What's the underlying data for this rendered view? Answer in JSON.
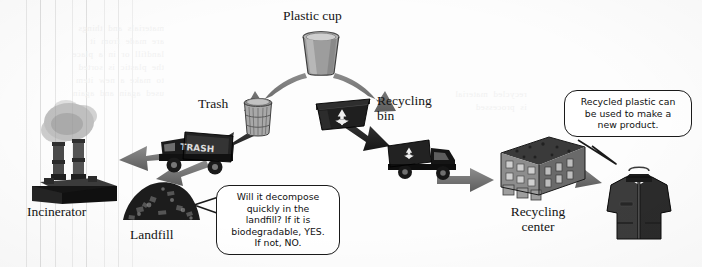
{
  "diagram": {
    "title_semantic": "plastic-cup-lifecycle-flow",
    "nodes": [
      {
        "id": "plastic-cup",
        "label": "Plastic cup",
        "icon": "plastic-cup-icon"
      },
      {
        "id": "trash",
        "label": "Trash",
        "icon": "trash-can-icon"
      },
      {
        "id": "recycling-bin",
        "label": "Recycling\nbin",
        "label_line1": "Recycling",
        "label_line2": "bin",
        "icon": "recycling-bin-icon"
      },
      {
        "id": "trash-truck",
        "label": "TRASH",
        "icon": "garbage-truck-icon"
      },
      {
        "id": "recycling-truck",
        "label": "",
        "icon": "recycling-truck-icon"
      },
      {
        "id": "incinerator",
        "label": "Incinerator",
        "icon": "incinerator-icon"
      },
      {
        "id": "landfill",
        "label": "Landfill",
        "icon": "landfill-icon"
      },
      {
        "id": "recycling-center",
        "label_line1": "Recycling",
        "label_line2": "center",
        "label": "Recycling center",
        "icon": "factory-icon"
      },
      {
        "id": "new-product",
        "label": "",
        "icon": "fleece-jacket-icon"
      }
    ],
    "callouts": [
      {
        "id": "landfill-question",
        "text": "Will it decompose quickly in the landfill? If it is biodegradable, YES. If not, NO.",
        "lines": [
          "Will it decompose",
          "quickly in the",
          "landfill? If it is",
          "biodegradable, YES.",
          "If not, NO."
        ]
      },
      {
        "id": "recycled-product-note",
        "text": "Recycled plastic can be used to make a new product.",
        "lines": [
          "Recycled plastic can",
          "be used to make a",
          "new product."
        ]
      }
    ],
    "flow_edges": [
      {
        "from": "plastic-cup",
        "to": "trash"
      },
      {
        "from": "plastic-cup",
        "to": "recycling-bin"
      },
      {
        "from": "trash",
        "to": "trash-truck"
      },
      {
        "from": "trash-truck",
        "to": "incinerator"
      },
      {
        "from": "trash-truck",
        "to": "landfill"
      },
      {
        "from": "recycling-bin",
        "to": "recycling-truck"
      },
      {
        "from": "recycling-truck",
        "to": "recycling-center"
      },
      {
        "from": "recycling-center",
        "to": "new-product"
      }
    ],
    "colors": {
      "arrow": "#6e6e6e",
      "arrow_dark": "#2b2b2b",
      "ink": "#141414",
      "background": "#fdfdfd",
      "scanline": "#e3e3e3",
      "bleed_text": "#f1f1f1"
    }
  },
  "background_bleed": {
    "block_left": "materials  and  things\nare  made  from  it\nlandfill  or  in  a  place\nthe  plastic  is  sorted\nto  make  a  new  item\nused  again  and  again",
    "block_right": "recycled  material\nis  processed"
  }
}
